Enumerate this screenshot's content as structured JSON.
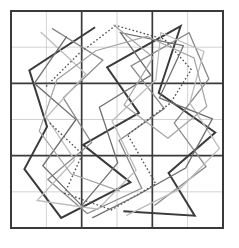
{
  "figure": {
    "title": "",
    "caption": "",
    "background_color": "#ffffff",
    "width": 239,
    "height": 248
  },
  "chart_data": {
    "type": "line",
    "title": "",
    "subtitle": "",
    "xlabel": "",
    "ylabel": "",
    "xlim": [
      0,
      6
    ],
    "ylim": [
      0,
      6
    ],
    "grid": true,
    "legend_position": "none",
    "xticks": [
      0,
      1,
      2,
      3,
      4,
      5,
      6
    ],
    "yticks": [
      0,
      1,
      2,
      3,
      4,
      5,
      6
    ],
    "xticklabels": [
      "",
      "",
      "",
      "",
      "",
      "",
      ""
    ],
    "yticklabels": [
      "",
      "",
      "",
      "",
      "",
      "",
      ""
    ],
    "grid_style": {
      "major_color": "#3a3a3a",
      "major_width": 1.7,
      "minor_color": "#c8c8c8",
      "minor_width": 0.8,
      "major_ticks": [
        0,
        2,
        4,
        6
      ],
      "minor_ticks": [
        1,
        3,
        5
      ],
      "border_color": "#3a3a3a",
      "border_width": 2.0
    },
    "annotations": [],
    "series": [
      {
        "name": "path-1",
        "color": "#3b3b3b",
        "linewidth": 2.0,
        "linestyle": "solid",
        "points": [
          [
            2.38,
            5.55
          ],
          [
            0.52,
            4.36
          ],
          [
            1.02,
            2.8
          ],
          [
            0.38,
            1.63
          ],
          [
            1.42,
            0.28
          ],
          [
            3.38,
            1.26
          ],
          [
            2.04,
            2.3
          ],
          [
            3.62,
            3.18
          ],
          [
            2.72,
            4.44
          ],
          [
            4.8,
            5.58
          ],
          [
            4.18,
            3.74
          ],
          [
            5.78,
            2.64
          ],
          [
            4.46,
            1.52
          ],
          [
            5.2,
            0.34
          ],
          [
            3.18,
            0.46
          ]
        ]
      },
      {
        "name": "path-2",
        "color": "#8a8a8a",
        "linewidth": 1.3,
        "linestyle": "solid",
        "points": [
          [
            1.16,
            5.52
          ],
          [
            2.6,
            4.64
          ],
          [
            1.48,
            3.6
          ],
          [
            2.28,
            2.36
          ],
          [
            1.04,
            1.34
          ],
          [
            2.16,
            0.4
          ],
          [
            3.7,
            1.1
          ],
          [
            3.06,
            2.42
          ],
          [
            4.34,
            3.3
          ],
          [
            3.4,
            4.48
          ],
          [
            5.04,
            5.4
          ],
          [
            5.6,
            4.12
          ],
          [
            4.62,
            2.9
          ],
          [
            5.52,
            1.7
          ],
          [
            4.06,
            0.62
          ]
        ]
      },
      {
        "name": "path-3",
        "color": "#bdbdbd",
        "linewidth": 1.3,
        "linestyle": "solid",
        "points": [
          [
            0.84,
            5.42
          ],
          [
            2.12,
            4.26
          ],
          [
            1.0,
            3.06
          ],
          [
            1.8,
            1.88
          ],
          [
            0.74,
            0.76
          ],
          [
            2.46,
            0.52
          ],
          [
            3.54,
            1.6
          ],
          [
            2.86,
            2.96
          ],
          [
            4.1,
            4.1
          ],
          [
            4.24,
            5.4
          ],
          [
            5.46,
            4.88
          ],
          [
            5.06,
            3.46
          ],
          [
            5.9,
            2.2
          ],
          [
            4.78,
            1.08
          ],
          [
            3.26,
            0.34
          ]
        ]
      },
      {
        "name": "path-4",
        "color": "#555555",
        "linewidth": 1.4,
        "linestyle": "dotted",
        "points": [
          [
            1.1,
            2.9
          ],
          [
            2.02,
            2.04
          ],
          [
            1.52,
            0.96
          ],
          [
            2.84,
            0.5
          ],
          [
            4.1,
            1.22
          ],
          [
            3.3,
            2.58
          ],
          [
            4.52,
            3.46
          ],
          [
            5.1,
            4.38
          ],
          [
            4.34,
            5.22
          ],
          [
            2.96,
            5.6
          ],
          [
            1.92,
            4.82
          ],
          [
            0.96,
            3.88
          ]
        ]
      },
      {
        "name": "path-5",
        "color": "#6f6f6f",
        "linewidth": 1.3,
        "linestyle": "solid",
        "points": [
          [
            1.58,
            5.3
          ],
          [
            0.66,
            4.0
          ],
          [
            1.84,
            3.0
          ],
          [
            0.9,
            1.72
          ],
          [
            2.0,
            0.62
          ],
          [
            3.02,
            1.8
          ],
          [
            2.5,
            3.34
          ],
          [
            3.96,
            4.22
          ],
          [
            3.1,
            5.4
          ],
          [
            4.88,
            5.04
          ],
          [
            4.2,
            3.6
          ],
          [
            5.7,
            3.02
          ],
          [
            4.94,
            1.66
          ],
          [
            3.6,
            0.92
          ],
          [
            2.3,
            0.28
          ]
        ]
      },
      {
        "name": "path-6",
        "color": "#a3a3a3",
        "linewidth": 1.2,
        "linestyle": "solid",
        "points": [
          [
            2.9,
            5.62
          ],
          [
            4.02,
            4.72
          ],
          [
            3.2,
            3.4
          ],
          [
            4.44,
            2.48
          ],
          [
            5.54,
            3.36
          ],
          [
            5.18,
            4.7
          ],
          [
            3.84,
            5.3
          ],
          [
            2.4,
            4.9
          ],
          [
            1.3,
            4.1
          ],
          [
            0.8,
            2.68
          ],
          [
            1.7,
            1.5
          ],
          [
            3.08,
            1.02
          ]
        ]
      }
    ]
  }
}
